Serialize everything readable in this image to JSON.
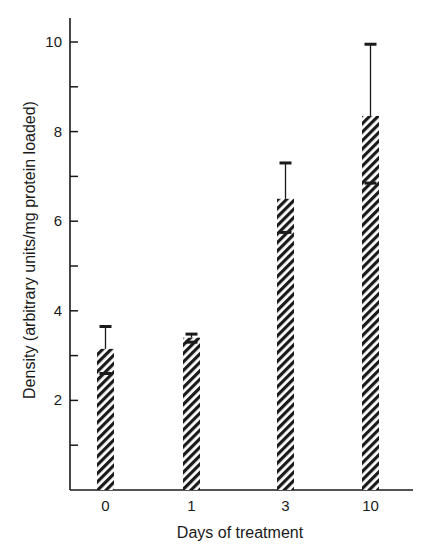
{
  "chart_data": {
    "type": "bar",
    "title": "",
    "xlabel": "Days of treatment",
    "ylabel": "Density (arbitrary units/mg protein loaded)",
    "categories": [
      "0",
      "1",
      "3",
      "10"
    ],
    "values": [
      3.15,
      3.4,
      6.5,
      8.35
    ],
    "error_upper": [
      3.65,
      3.48,
      7.3,
      9.95
    ],
    "error_lower": [
      2.6,
      3.3,
      5.75,
      6.85
    ],
    "ylim": [
      0,
      10.5
    ],
    "yticks_major": [
      2,
      4,
      6,
      8,
      10
    ],
    "yticks_minor": [
      1,
      3,
      5,
      7,
      9
    ],
    "grid": false,
    "legend": null,
    "bar_fill": "diagonal hatch (black on white)"
  },
  "colors": {
    "ink": "#1a1a1a",
    "background": "#ffffff"
  },
  "layout": {
    "axis_x": 70,
    "axis_top": 18,
    "baseline_y": 490,
    "axis_right": 413,
    "px_per_unit": 44.8,
    "bar_left": [
      97,
      183,
      277,
      362
    ],
    "bar_width": 17
  }
}
